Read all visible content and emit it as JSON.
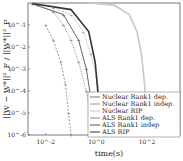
{
  "chart_data": {
    "type": "line",
    "xlabel": "time(s)",
    "ylabel": "||W − W*||²_F / ||W*||²_F",
    "xscale": "log",
    "yscale": "log",
    "xlim": [
      0.002,
      2000
    ],
    "ylim": [
      1e-06,
      1
    ],
    "xticks": [
      "10^-2",
      "10^0",
      "10^2"
    ],
    "yticks": [
      "10^-1",
      "10^-2",
      "10^-3",
      "10^-4",
      "10^-5",
      "10^-6"
    ],
    "legend_position": "lower right",
    "series": [
      {
        "name": "Nuclear Rank1 dep.",
        "color": "#777777",
        "style": "dotted-marker",
        "x": [
          0.005,
          0.02,
          0.05,
          0.1,
          0.2,
          0.4,
          0.8
        ],
        "y": [
          0.8,
          0.4,
          0.1,
          0.02,
          0.002,
          0.0001,
          1e-06
        ]
      },
      {
        "name": "Nuclear Rank1 indep.",
        "color": "#999999",
        "style": "dotted-marker",
        "x": [
          0.02,
          0.1,
          0.3,
          0.6,
          1.0,
          1.5,
          2.0
        ],
        "y": [
          0.6,
          0.3,
          0.05,
          0.005,
          0.0005,
          3e-05,
          1e-06
        ]
      },
      {
        "name": "Nuclear RIP",
        "color": "#c8c8c8",
        "style": "solid",
        "x": [
          0.5,
          5,
          20,
          40,
          60,
          80,
          100
        ],
        "y": [
          1,
          0.8,
          0.3,
          0.05,
          0.005,
          0.0002,
          1e-06
        ]
      },
      {
        "name": "ALS Rank1 dep.",
        "color": "#888888",
        "style": "dashed-marker",
        "x": [
          0.01,
          0.02,
          0.04,
          0.06,
          0.08,
          0.1
        ],
        "y": [
          0.1,
          0.02,
          0.002,
          0.0002,
          1e-05,
          1e-06
        ]
      },
      {
        "name": "ALS Rank1 indep",
        "color": "#555555",
        "style": "solid-marker",
        "x": [
          0.003,
          0.05,
          0.2,
          0.4,
          0.6,
          0.8
        ],
        "y": [
          0.9,
          0.3,
          0.02,
          0.001,
          5e-05,
          1e-06
        ]
      },
      {
        "name": "ALS RIP",
        "color": "#333333",
        "style": "solid",
        "x": [
          0.003,
          0.1,
          0.5,
          0.9,
          1.2,
          1.5
        ],
        "y": [
          0.95,
          0.5,
          0.05,
          0.002,
          5e-05,
          1e-06
        ]
      }
    ]
  }
}
